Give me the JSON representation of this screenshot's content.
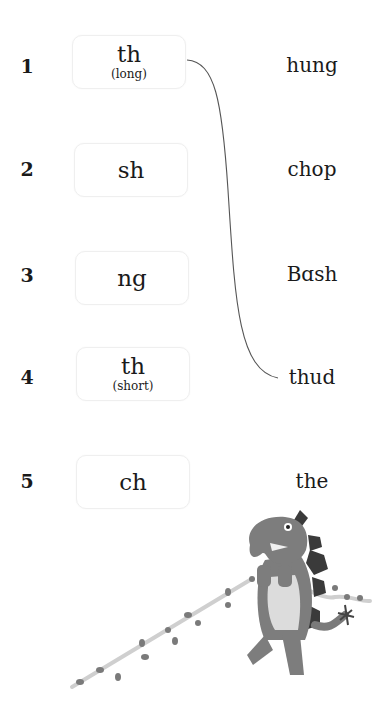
{
  "rows": [
    {
      "number": "1",
      "sound": "th",
      "note": "(long)"
    },
    {
      "number": "2",
      "sound": "sh",
      "note": ""
    },
    {
      "number": "3",
      "sound": "ng",
      "note": ""
    },
    {
      "number": "4",
      "sound": "th",
      "note": "(short)"
    },
    {
      "number": "5",
      "sound": "ch",
      "note": ""
    }
  ],
  "words": [
    "hung",
    "chop",
    "Bɑsh",
    "thud",
    "the"
  ],
  "connections": [
    {
      "from_row": 1,
      "to_word": "thud"
    }
  ],
  "illustration": "dinosaur-pulling-vine"
}
